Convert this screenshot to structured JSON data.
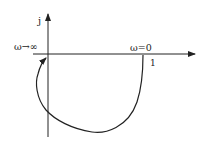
{
  "diagram": {
    "type": "nyquist-plot",
    "axes": {
      "imag_label": "j",
      "real_label": ""
    },
    "labels": {
      "omega_infinity": "ω→∞",
      "omega_zero": "ω=0",
      "real_point": "1"
    },
    "colors": {
      "line": "#222222",
      "background": "#ffffff"
    }
  }
}
